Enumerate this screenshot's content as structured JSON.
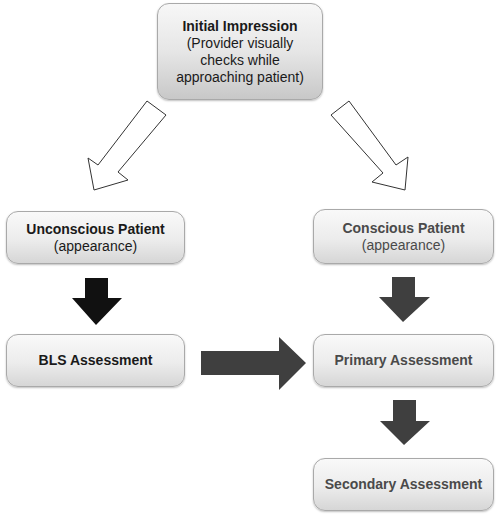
{
  "diagram": {
    "nodes": {
      "initial": {
        "title": "Initial Impression",
        "lines": [
          "(Provider visually",
          "checks while",
          "approaching patient)"
        ]
      },
      "unconscious": {
        "title": "Unconscious Patient",
        "sub": "(appearance)"
      },
      "conscious": {
        "title": "Conscious Patient",
        "sub": "(appearance)"
      },
      "bls": {
        "title": "BLS Assessment"
      },
      "primary": {
        "title": "Primary Assessment"
      },
      "secondary": {
        "title": "Secondary Assessment"
      }
    },
    "edges": [
      {
        "from": "Initial Impression",
        "to": "Unconscious Patient",
        "style": "hollow"
      },
      {
        "from": "Initial Impression",
        "to": "Conscious Patient",
        "style": "hollow"
      },
      {
        "from": "Unconscious Patient",
        "to": "BLS Assessment",
        "style": "solid-black"
      },
      {
        "from": "Conscious Patient",
        "to": "Primary Assessment",
        "style": "solid-dark-gray"
      },
      {
        "from": "BLS Assessment",
        "to": "Primary Assessment",
        "style": "solid-dark-gray"
      },
      {
        "from": "Primary Assessment",
        "to": "Secondary Assessment",
        "style": "solid-dark-gray"
      }
    ],
    "colors": {
      "arrow_black": "#111111",
      "arrow_dark_gray": "#3f3f3f",
      "hollow_stroke": "#333333",
      "box_border": "#a9a9a9",
      "text_dark": "#1a1a1a",
      "text_gray": "#4a4a4a"
    }
  }
}
